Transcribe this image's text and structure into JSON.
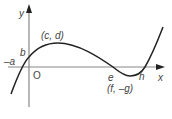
{
  "diagram": {
    "type": "cubic-curve-graph",
    "axes": {
      "x_label": "x",
      "y_label": "y",
      "origin_label": "O"
    },
    "points": {
      "x_intercept_left": "–a",
      "y_intercept": "b",
      "maximum": "(c, d)",
      "x_intercept_mid": "e",
      "minimum": "(f, –g)",
      "x_intercept_right": "h"
    },
    "colors": {
      "axis": "#888888",
      "curve": "#222222",
      "text": "#444444"
    }
  }
}
